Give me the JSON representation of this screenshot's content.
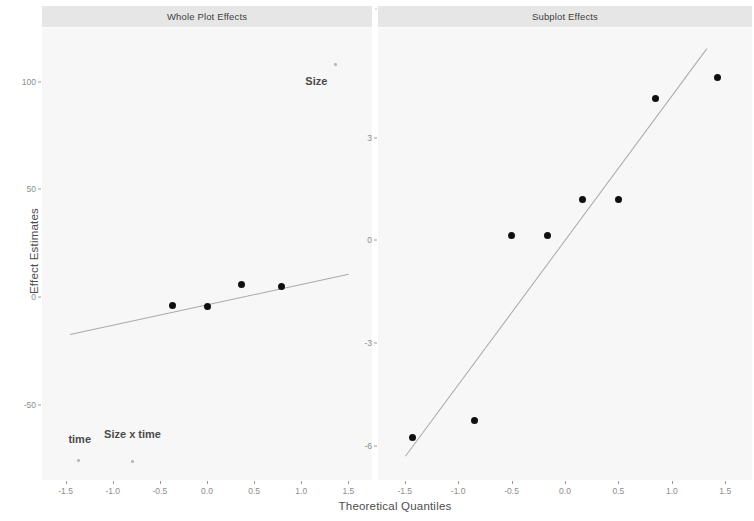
{
  "figure": {
    "width": 754,
    "height": 521,
    "background": "#ffffff",
    "panel_fill": "#f7f7f7",
    "strip_fill": "#e6e6e6",
    "point_color": "#101010",
    "line_color": "#a9a9a9",
    "tick_text_color": "#8c8c8c",
    "axis_title_color": "#4d4d4d"
  },
  "axis": {
    "xlabel": "Theoretical Quantiles",
    "ylabel": "Effect Estimates"
  },
  "chart_data": [
    {
      "type": "scatter",
      "title": "Whole Plot Effects",
      "xlabel": "Theoretical Quantiles",
      "ylabel": "Effect Estimates",
      "xlim": [
        -1.75,
        1.75
      ],
      "ylim": [
        -85,
        125
      ],
      "xticks": [
        "-1.5",
        "-1.0",
        "-0.5",
        "0.0",
        "0.5",
        "1.0",
        "1.5"
      ],
      "xtick_values": [
        -1.5,
        -1.0,
        -0.5,
        0.0,
        0.5,
        1.0,
        1.5
      ],
      "yticks": [
        "100",
        "50",
        "0",
        "-50"
      ],
      "ytick_values": [
        100,
        50,
        0,
        -50
      ],
      "grid": false,
      "legend": "none",
      "points": [
        {
          "x": -1.36,
          "y": -76.0,
          "label": "time"
        },
        {
          "x": -0.79,
          "y": -76.5,
          "label": "Size x time"
        },
        {
          "x": -0.37,
          "y": -4.0,
          "label": ""
        },
        {
          "x": 0.0,
          "y": -4.5,
          "label": ""
        },
        {
          "x": 0.37,
          "y": 6.0,
          "label": ""
        },
        {
          "x": 0.79,
          "y": 5.0,
          "label": ""
        },
        {
          "x": 1.36,
          "y": 108.0,
          "label": "Size"
        }
      ],
      "annotations": [
        {
          "text": "Size",
          "x": 1.16,
          "y": 103.0
        },
        {
          "text": "time",
          "x": -1.35,
          "y": -63.0
        },
        {
          "text": "Size x time",
          "x": -0.79,
          "y": -61.0
        }
      ],
      "reference_line": {
        "x1": -1.45,
        "y1": -17.0,
        "x2": 1.5,
        "y2": 11.0
      }
    },
    {
      "type": "scatter",
      "title": "Subplot Effects",
      "xlabel": "Theoretical Quantiles",
      "ylabel": "Effect Estimates",
      "xlim": [
        -1.75,
        1.75
      ],
      "ylim": [
        -7.0,
        6.2
      ],
      "xticks": [
        "-1.5",
        "-1.0",
        "-0.5",
        "0.0",
        "0.5",
        "1.0",
        "1.5"
      ],
      "xtick_values": [
        -1.5,
        -1.0,
        -0.5,
        0.0,
        0.5,
        1.0,
        1.5
      ],
      "yticks": [
        "3",
        "0",
        "-3",
        "-6"
      ],
      "ytick_values": [
        3,
        0,
        -3,
        -6
      ],
      "grid": false,
      "legend": "none",
      "points": [
        {
          "x": -1.43,
          "y": -5.75
        },
        {
          "x": -0.85,
          "y": -5.25
        },
        {
          "x": -0.5,
          "y": 0.15
        },
        {
          "x": -0.16,
          "y": 0.15
        },
        {
          "x": 0.16,
          "y": 1.2
        },
        {
          "x": 0.5,
          "y": 1.2
        },
        {
          "x": 0.85,
          "y": 4.15
        },
        {
          "x": 1.43,
          "y": 4.75
        }
      ],
      "annotations": [],
      "reference_line": {
        "x1": -1.5,
        "y1": -6.3,
        "x2": 1.32,
        "y2": 5.6
      }
    }
  ]
}
